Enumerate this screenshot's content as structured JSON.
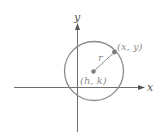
{
  "diagram": {
    "axes": {
      "x_label": "x",
      "y_label": "y"
    },
    "center": {
      "label": "(h, k)"
    },
    "point_on_circle": {
      "label": "(x, y)"
    },
    "radius": {
      "label": "r"
    },
    "colors": {
      "axis": "#6e6e6e",
      "circle": "#8a8a8a",
      "points": "#7a7a7a",
      "labels": "#8c8c8c"
    }
  }
}
